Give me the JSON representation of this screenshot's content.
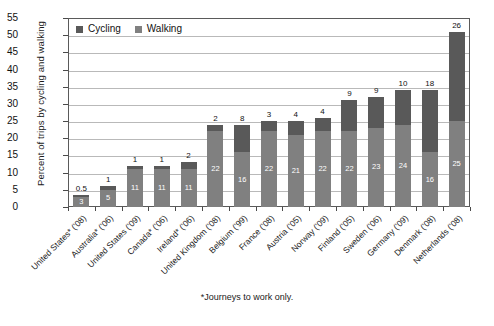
{
  "chart_data": {
    "type": "bar",
    "title": "",
    "subtitle": "",
    "xlabel": "",
    "ylabel": "Percent of trips by cycling and walking",
    "ylim": [
      0,
      55
    ],
    "ytick_step": 5,
    "yticks": [
      "0",
      "5",
      "10",
      "15",
      "20",
      "25",
      "30",
      "35",
      "40",
      "45",
      "50",
      "55"
    ],
    "grid": true,
    "stacked": true,
    "legend_position": "top-left",
    "categories": [
      "United States* ('08)",
      "Australia* ('06)",
      "United States ('09)",
      "Canada* ('06)",
      "Ireland* ('06)",
      "United Kingdom ('08)",
      "Belgium ('99)",
      "France ('08)",
      "Austria ('05)",
      "Norway ('09)",
      "Finland ('05)",
      "Sweden ('06)",
      "Germany ('09)",
      "Denmark ('08)",
      "Netherlands ('08)"
    ],
    "series": [
      {
        "name": "Walking",
        "color": "#808080",
        "values": [
          3,
          5,
          11,
          11,
          11,
          22,
          16,
          22,
          21,
          22,
          22,
          23,
          24,
          16,
          25
        ]
      },
      {
        "name": "Cycling",
        "color": "#595959",
        "values": [
          0.5,
          1,
          1,
          1,
          2,
          2,
          8,
          3,
          4,
          4,
          9,
          9,
          10,
          18,
          26
        ]
      }
    ],
    "totals": [
      3.5,
      6,
      12,
      12,
      13,
      24,
      24,
      25,
      25,
      26,
      31,
      32,
      34,
      34,
      51
    ],
    "annotation": "*Journeys to work only."
  },
  "legend": {
    "items": [
      {
        "label": "Cycling",
        "swatch": "cycling-swatch"
      },
      {
        "label": "Walking",
        "swatch": "walking-swatch"
      }
    ]
  },
  "footnote": "*Journeys to work only.",
  "colors": {
    "cycling": "#595959",
    "walking": "#808080",
    "grid": "#b9b9b9",
    "frame": "#5a5a5a",
    "background": "#ffffff"
  }
}
